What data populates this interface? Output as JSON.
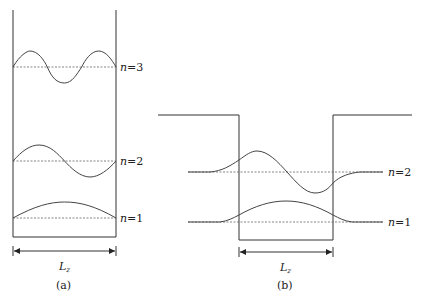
{
  "panels": [
    {
      "id": "a",
      "caption": "(a)",
      "title": "Infinite square well",
      "width_label": "L",
      "width_label_subscript": "z",
      "levels": [
        {
          "n": 3,
          "label_var": "n",
          "label_eq": "=3"
        },
        {
          "n": 2,
          "label_var": "n",
          "label_eq": "=2"
        },
        {
          "n": 1,
          "label_var": "n",
          "label_eq": "=1"
        }
      ]
    },
    {
      "id": "b",
      "caption": "(b)",
      "title": "Finite square well",
      "width_label": "L",
      "width_label_subscript": "z",
      "levels": [
        {
          "n": 2,
          "label_var": "n",
          "label_eq": "=2"
        },
        {
          "n": 1,
          "label_var": "n",
          "label_eq": "=1"
        }
      ]
    }
  ],
  "colors": {
    "line": "#333333",
    "wave": "#444444",
    "dashed": "#666666",
    "background": "#ffffff"
  }
}
